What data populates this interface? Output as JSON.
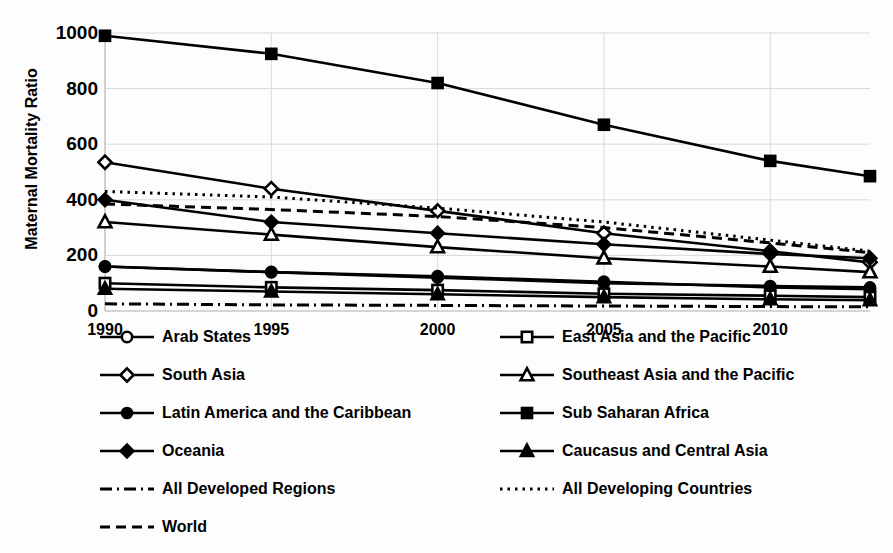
{
  "chart_data": {
    "type": "line",
    "title": "",
    "subtitle": "",
    "xlabel": "",
    "ylabel": "Maternal Mortality Ratio",
    "x": [
      1990,
      1995,
      2000,
      2005,
      2010,
      2013
    ],
    "xticklabels": [
      "1990",
      "1995",
      "2000",
      "2005",
      "2010"
    ],
    "xtickvalues": [
      1990,
      1995,
      2000,
      2005,
      2010
    ],
    "yticklabels": [
      "0",
      "200",
      "400",
      "600",
      "800",
      "1000"
    ],
    "ytickvalues": [
      0,
      200,
      400,
      600,
      800,
      1000
    ],
    "ylim": [
      0,
      1000
    ],
    "xlim": [
      1990,
      2013
    ],
    "grid": true,
    "legend_position": "bottom",
    "series": [
      {
        "name": "Arab States",
        "marker": "circle-open",
        "linestyle": "solid",
        "values": [
          160,
          140,
          125,
          105,
          85,
          78
        ]
      },
      {
        "name": "East Asia and the Pacific",
        "marker": "square-open",
        "linestyle": "solid",
        "values": [
          100,
          85,
          75,
          62,
          55,
          50
        ]
      },
      {
        "name": "South Asia",
        "marker": "diamond-open",
        "linestyle": "solid",
        "values": [
          535,
          440,
          360,
          280,
          215,
          175
        ]
      },
      {
        "name": "Southeast Asia and the Pacific",
        "marker": "triangle-open",
        "linestyle": "solid",
        "values": [
          320,
          275,
          230,
          190,
          160,
          140
        ]
      },
      {
        "name": "Latin America and the Caribbean",
        "marker": "circle-filled",
        "linestyle": "solid",
        "values": [
          160,
          140,
          120,
          100,
          90,
          85
        ]
      },
      {
        "name": "Sub Saharan Africa",
        "marker": "square-filled",
        "linestyle": "solid",
        "values": [
          990,
          925,
          820,
          670,
          540,
          485
        ]
      },
      {
        "name": "Oceania",
        "marker": "diamond-filled",
        "linestyle": "solid",
        "values": [
          400,
          320,
          280,
          240,
          205,
          190
        ]
      },
      {
        "name": "Caucasus and Central Asia",
        "marker": "triangle-filled",
        "linestyle": "solid",
        "values": [
          80,
          70,
          60,
          50,
          42,
          39
        ]
      },
      {
        "name": "All Developed Regions",
        "marker": "none",
        "linestyle": "dashdot",
        "values": [
          26,
          22,
          20,
          18,
          16,
          15
        ]
      },
      {
        "name": "All Developing Countries",
        "marker": "none",
        "linestyle": "dotted",
        "values": [
          430,
          410,
          370,
          320,
          255,
          215
        ]
      },
      {
        "name": "World",
        "marker": "none",
        "linestyle": "dashed",
        "values": [
          385,
          365,
          340,
          300,
          245,
          210
        ]
      }
    ]
  },
  "legend": {
    "rows": [
      {
        "left": "Arab States",
        "right": "East Asia and the Pacific"
      },
      {
        "left": "South Asia",
        "right": "Southeast Asia and the Pacific"
      },
      {
        "left": "Latin America and the Caribbean",
        "right": "Sub Saharan Africa"
      },
      {
        "left": "Oceania",
        "right": "Caucasus and Central Asia"
      },
      {
        "left": "All Developed Regions",
        "right": "All Developing Countries"
      },
      {
        "left": "World",
        "right": ""
      }
    ]
  },
  "colors": {
    "line": "#000000",
    "grid": "#d9d9d9",
    "axis": "#bfbfbf",
    "background": "#fdfdfd",
    "text": "#000000"
  }
}
